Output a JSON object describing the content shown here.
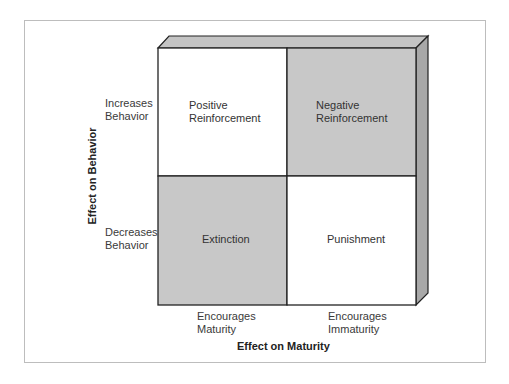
{
  "diagram": {
    "type": "2x2 matrix",
    "y_axis": {
      "title": "Effect on Behavior",
      "labels": [
        {
          "line1": "Increases",
          "line2": "Behavior"
        },
        {
          "line1": "Decreases",
          "line2": "Behavior"
        }
      ]
    },
    "x_axis": {
      "title": "Effect on Maturity",
      "labels": [
        {
          "line1": "Encourages",
          "line2": "Maturity"
        },
        {
          "line1": "Encourages",
          "line2": "Immaturity"
        }
      ]
    },
    "cells": [
      {
        "position": "top-left",
        "line1": "Positive",
        "line2": "Reinforcement",
        "fill": "#ffffff"
      },
      {
        "position": "top-right",
        "line1": "Negative",
        "line2": "Reinforcement",
        "fill": "#c8c8c8"
      },
      {
        "position": "bottom-left",
        "line1": "Extinction",
        "line2": "",
        "fill": "#c8c8c8"
      },
      {
        "position": "bottom-right",
        "line1": "Punishment",
        "line2": "",
        "fill": "#ffffff"
      }
    ],
    "colors": {
      "shaded": "#c8c8c8",
      "top_face": "#c4c4c4",
      "side_face": "#a8a8a8",
      "line": "#222222",
      "frame": "#bdbdbd"
    }
  }
}
